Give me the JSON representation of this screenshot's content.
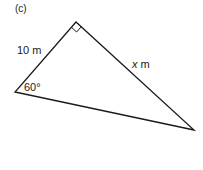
{
  "figure": {
    "panel_label": "(c)",
    "shape": "right triangle",
    "vertices": {
      "right_angle": [
        76,
        22
      ],
      "left": [
        15,
        92
      ],
      "right": [
        194,
        130
      ]
    },
    "labels": {
      "side_hypotenuse_adjacent": {
        "value": "10",
        "unit": "m"
      },
      "angle": "60°",
      "side_unknown": {
        "variable": "x",
        "unit": "m"
      }
    },
    "right_angle_marker": true,
    "stroke_color": "#1a1a1a",
    "background_color": "#ffffff"
  }
}
